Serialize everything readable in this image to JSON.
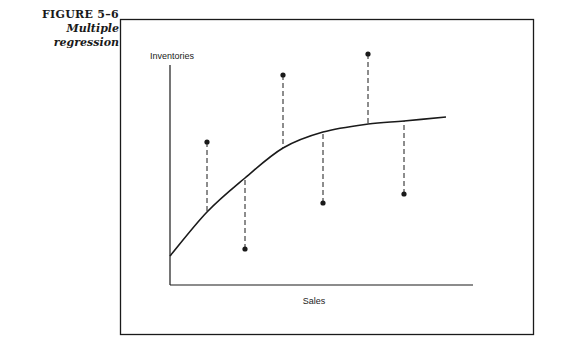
{
  "caption": {
    "figure_number": "FIGURE 5–6",
    "title": "Multiple regression"
  },
  "chart_data": {
    "type": "scatter",
    "title": "Multiple regression",
    "xlabel": "Sales",
    "ylabel": "Inventories",
    "grid": false,
    "legend": null,
    "ticks": {
      "x": [],
      "y": []
    },
    "points": [
      {
        "x": 207,
        "y": 142,
        "fit_y": 212
      },
      {
        "x": 245,
        "y": 249,
        "fit_y": 178
      },
      {
        "x": 283,
        "y": 75,
        "fit_y": 148
      },
      {
        "x": 323,
        "y": 203,
        "fit_y": 132
      },
      {
        "x": 368,
        "y": 54,
        "fit_y": 124
      },
      {
        "x": 404,
        "y": 194,
        "fit_y": 121
      }
    ],
    "curve": [
      [
        170,
        256
      ],
      [
        207,
        212
      ],
      [
        245,
        178
      ],
      [
        283,
        148
      ],
      [
        323,
        132
      ],
      [
        368,
        124
      ],
      [
        404,
        121
      ],
      [
        446,
        117
      ]
    ],
    "units": "pixel coordinates (no numeric scale shown)"
  },
  "colors": {
    "ink": "#1a1a1a",
    "background": "#ffffff"
  }
}
